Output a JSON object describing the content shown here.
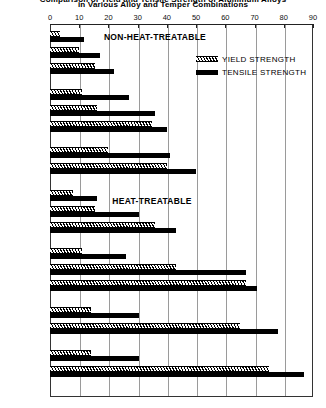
{
  "chart_data": {
    "type": "bar",
    "orientation": "horizontal",
    "title": "Comparison of Yield and Tensile Strength of Aluminum Alloys",
    "title_line2": "in Various Alloy and Temper Combinations",
    "xlabel": "",
    "ylabel": "",
    "xlim": [
      0,
      90
    ],
    "xticks": [
      0,
      10,
      20,
      30,
      40,
      50,
      60,
      70,
      80,
      90
    ],
    "grid": true,
    "grid_axis": "x",
    "legend_position": "upper right",
    "categories": [
      "1100-0",
      "1100-H14",
      "1100-H18",
      "5052-0",
      "5052-H34",
      "5052-H38",
      "5083-0",
      "5083-H343",
      "6061-0",
      "6061-T4",
      "6061-T6",
      "2024-0",
      "2024-T3",
      "2024-T86",
      "7075-0",
      "7075-T6",
      "7178-0",
      "7178-T6"
    ],
    "series": [
      {
        "name": "YIELD STRENGTH",
        "pattern": "hatched",
        "values": [
          3.5,
          10,
          15.5,
          11,
          16,
          35,
          20,
          40,
          8,
          15.5,
          36,
          11,
          43,
          67,
          14,
          65,
          14,
          75
        ]
      },
      {
        "name": "TENSILE STRENGTH",
        "pattern": "solid",
        "values": [
          11.5,
          17,
          22,
          27,
          36,
          40,
          41,
          50,
          16,
          30.5,
          43,
          26,
          67,
          71,
          30.5,
          78,
          30.5,
          87
        ]
      }
    ],
    "annotations": [
      {
        "text": "NON-HEAT-TREATABLE",
        "x": 155,
        "y": 32
      },
      {
        "text": "HEAT-TREATABLE",
        "x": 152,
        "y": 196
      }
    ],
    "groups": [
      {
        "name": "1100",
        "start": 0,
        "count": 3
      },
      {
        "name": "5052",
        "start": 3,
        "count": 3
      },
      {
        "name": "5083",
        "start": 6,
        "count": 2
      },
      {
        "name": "6061",
        "start": 8,
        "count": 3
      },
      {
        "name": "2024",
        "start": 11,
        "count": 3
      },
      {
        "name": "7075",
        "start": 14,
        "count": 2
      },
      {
        "name": "7178",
        "start": 16,
        "count": 2
      }
    ],
    "row_tops": [
      30,
      46,
      62,
      88,
      104,
      120,
      146,
      162,
      189,
      205,
      221,
      247,
      263,
      279,
      306,
      322,
      349,
      365
    ],
    "colors": {
      "bar": "#000000",
      "axis": "#222222",
      "grid": "#9a9a9a",
      "background": "#ffffff"
    }
  },
  "legend": {
    "items": [
      {
        "label": "YIELD   STRENGTH",
        "swatch": "yield"
      },
      {
        "label": "TENSILE  STRENGTH",
        "swatch": "tensile"
      }
    ]
  }
}
